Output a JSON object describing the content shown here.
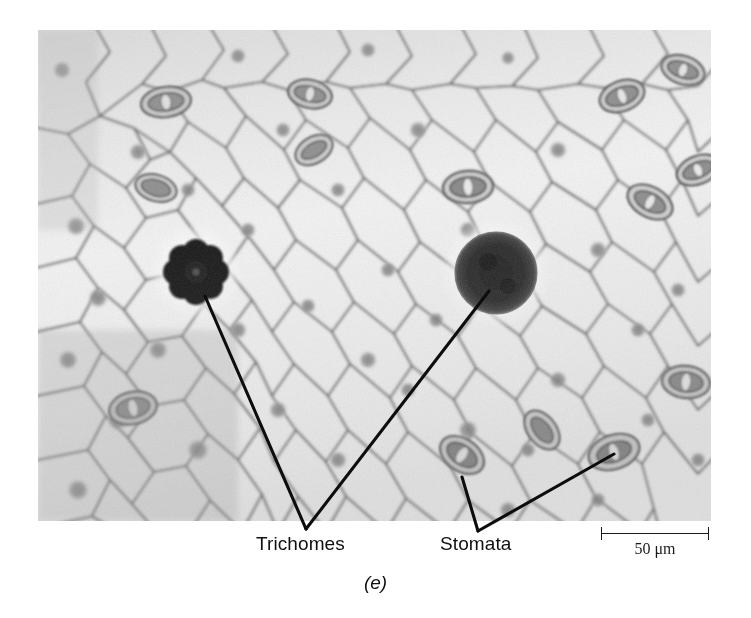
{
  "figure": {
    "panel_caption": "(e)",
    "image_type": "grayscale light micrograph"
  },
  "annotations": {
    "labels": [
      {
        "id": "trichomes",
        "text": "Trichomes"
      },
      {
        "id": "stomata",
        "text": "Stomata"
      }
    ],
    "leader_lines": [
      {
        "label": "trichomes",
        "from_x": 205,
        "from_y": 296,
        "to_x": 306,
        "to_y": 529
      },
      {
        "label": "trichomes",
        "from_x": 489,
        "from_y": 291,
        "to_x": 306,
        "to_y": 529
      },
      {
        "label": "stomata",
        "from_x": 462,
        "from_y": 477,
        "to_x": 478,
        "to_y": 531
      },
      {
        "label": "stomata",
        "from_x": 614,
        "from_y": 454,
        "to_x": 478,
        "to_y": 531
      }
    ]
  },
  "scale_bar": {
    "value": "50",
    "unit": "μm",
    "text": "50 μm",
    "length_px": 108
  },
  "specimen": {
    "features": [
      {
        "name": "trichome",
        "shape": "rosette",
        "cx": 196,
        "cy": 272,
        "r": 33,
        "lobes": 8
      },
      {
        "name": "trichome",
        "shape": "round",
        "cx": 496,
        "cy": 273,
        "r": 40
      }
    ],
    "stomata": [
      {
        "cx": 128,
        "cy": 72,
        "rx": 25,
        "ry": 15,
        "angle": -8
      },
      {
        "cx": 272,
        "cy": 64,
        "rx": 22,
        "ry": 14,
        "angle": 12
      },
      {
        "cx": 430,
        "cy": 157,
        "rx": 25,
        "ry": 16,
        "angle": -4
      },
      {
        "cx": 584,
        "cy": 66,
        "rx": 23,
        "ry": 15,
        "angle": -20
      },
      {
        "cx": 689,
        "cy": 60,
        "rx": 22,
        "ry": 14,
        "angle": 18
      },
      {
        "cx": 612,
        "cy": 172,
        "rx": 24,
        "ry": 15,
        "angle": 28
      },
      {
        "cx": 676,
        "cy": 146,
        "rx": 22,
        "ry": 14,
        "angle": -22
      },
      {
        "cx": 659,
        "cy": 352,
        "rx": 24,
        "ry": 16,
        "angle": 8
      },
      {
        "cx": 105,
        "cy": 418,
        "rx": 24,
        "ry": 16,
        "angle": -12
      },
      {
        "cx": 276,
        "cy": 120,
        "rx": 20,
        "ry": 13,
        "angle": -30
      },
      {
        "cx": 462,
        "cy": 455,
        "rx": 24,
        "ry": 16,
        "angle": 34
      },
      {
        "cx": 614,
        "cy": 452,
        "rx": 26,
        "ry": 17,
        "angle": -18
      },
      {
        "cx": 542,
        "cy": 430,
        "rx": 22,
        "ry": 14,
        "angle": 52
      },
      {
        "cx": 128,
        "cy": 188,
        "rx": 21,
        "ry": 13,
        "angle": 16
      }
    ]
  },
  "colors": {
    "background": "#ffffff",
    "cell_wall": "#555555",
    "cell_interior": "#f2f2f2",
    "trichome": "#1a1a1a",
    "leader_line": "#0d0d0d",
    "text": "#111111"
  }
}
